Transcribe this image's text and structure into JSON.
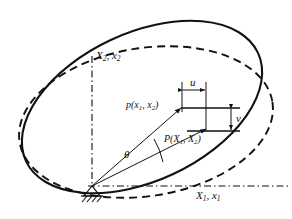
{
  "figure": {
    "type": "engineering-mechanics-diagram",
    "background_color": "#ffffff",
    "line_color": "#111111"
  },
  "axes": {
    "origin_label": "",
    "horizontal": {
      "name": "horizontal-axis",
      "label": "X",
      "sub1": "1",
      "sep": ", ",
      "label2": "x",
      "sub2": "1",
      "full": "X1, x1",
      "style": "dash-dot"
    },
    "vertical": {
      "name": "vertical-axis",
      "label": "X",
      "sub1": "2",
      "sep": ", ",
      "label2": "x",
      "sub2": "2",
      "full": "X2, x2",
      "style": "dash-dot"
    }
  },
  "points": {
    "deformed": {
      "name": "point-p-lowercase",
      "prefix": "p",
      "open": "(",
      "arg1": "x",
      "sub1": "1",
      "comma": ", ",
      "arg2": "x",
      "sub2": "2",
      "close": ")",
      "full": "p(x1, x2)"
    },
    "original": {
      "name": "point-P-uppercase",
      "prefix": "P",
      "open": "(",
      "arg1": "X",
      "sub1": "1",
      "comma": ", ",
      "arg2": "X",
      "sub2": "2",
      "close": ")",
      "full": "P(X1, X2)"
    }
  },
  "displacements": {
    "horizontal_component": {
      "name": "u-dimension",
      "label": "u",
      "orientation": "horizontal",
      "arrow": "double"
    },
    "vertical_component": {
      "name": "v-dimension",
      "label": "v",
      "orientation": "vertical",
      "arrow": "double"
    }
  },
  "angle": {
    "name": "theta-angle",
    "label": "θ",
    "between": "ray-to-P and ray-to-p"
  },
  "curves": {
    "rotated_body": {
      "name": "rotated-ellipse",
      "style": "solid"
    },
    "original_body": {
      "name": "original-ellipse",
      "style": "dashed"
    }
  },
  "support": {
    "name": "pin-support",
    "type": "hatched-ground-triangle"
  }
}
